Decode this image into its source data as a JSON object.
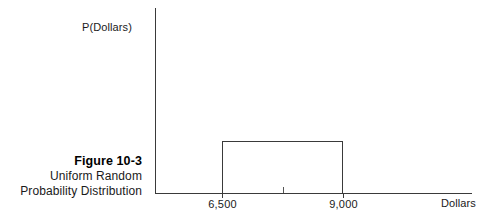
{
  "figure": {
    "caption_title": "Figure 10-3",
    "caption_lines": [
      "Uniform Random",
      "Probability Distribution"
    ],
    "top_clipped_text": ""
  },
  "axes": {
    "y_axis_label": "P(Dollars)",
    "x_axis_label": "Dollars"
  },
  "chart_data": {
    "type": "area",
    "title": "Figure 10-3 Uniform Random Probability Distribution",
    "xlabel": "Dollars",
    "ylabel": "P(Dollars)",
    "distribution": "uniform",
    "x_tick_labels": [
      "6,500",
      "9,000"
    ],
    "x_tick_values": [
      6500,
      9000
    ],
    "midpoint_tick_value": 7750,
    "support": [
      6500,
      9000
    ],
    "series": [
      {
        "name": "Uniform density",
        "x": [
          6500,
          6500,
          9000,
          9000
        ],
        "values": [
          0,
          1,
          1,
          0
        ]
      }
    ],
    "grid": false,
    "legend": "none",
    "y_axis_ticks": []
  },
  "colors": {
    "line": "#3a3a3a",
    "text": "#1a1a1a",
    "background": "#ffffff"
  }
}
